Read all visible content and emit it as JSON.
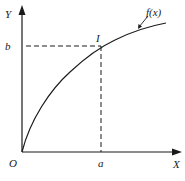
{
  "diagram": {
    "type": "function-graph",
    "axes": {
      "y_label": "Y",
      "x_label": "X",
      "origin_label": "O"
    },
    "point": {
      "label": "I",
      "x_label": "a",
      "y_label": "b"
    },
    "curve": {
      "label": "f(x)",
      "shape": "concave-down increasing from origin"
    },
    "colors": {
      "stroke": "#1a1a1a",
      "background": "#ffffff"
    }
  }
}
